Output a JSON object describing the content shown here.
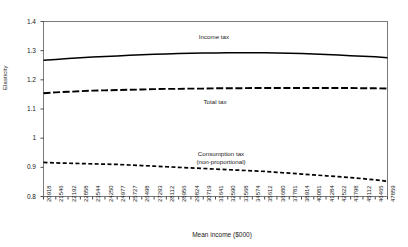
{
  "chart_data": {
    "type": "line",
    "title": "",
    "xlabel": "Mean income ($000)",
    "ylabel": "Elasticity",
    "ylim": [
      0.8,
      1.4
    ],
    "yticks": [
      "0.8",
      "0.9",
      "1",
      "1.1",
      "1.2",
      "1.3",
      "1.4"
    ],
    "ytick_values": [
      0.8,
      0.9,
      1.0,
      1.1,
      1.2,
      1.3,
      1.4
    ],
    "grid": false,
    "legend_position": "inline-annotations",
    "categories": [
      "20918",
      "21546",
      "22192",
      "22858",
      "23544",
      "24250",
      "24977",
      "25727",
      "26498",
      "27293",
      "28112",
      "28956",
      "29824",
      "30719",
      "31641",
      "32590",
      "33568",
      "34574",
      "35612",
      "36680",
      "37781",
      "38914",
      "40081",
      "41284",
      "42522",
      "43798",
      "45112",
      "46465",
      "47859"
    ],
    "series": [
      {
        "name": "Income tax",
        "style": "solid",
        "color": "#000000",
        "label_text": "Income tax",
        "values": [
          1.267,
          1.27,
          1.273,
          1.276,
          1.278,
          1.28,
          1.282,
          1.284,
          1.286,
          1.288,
          1.289,
          1.29,
          1.291,
          1.292,
          1.292,
          1.293,
          1.293,
          1.293,
          1.293,
          1.292,
          1.291,
          1.29,
          1.289,
          1.287,
          1.285,
          1.283,
          1.281,
          1.279,
          1.276
        ]
      },
      {
        "name": "Total tax",
        "style": "dashed",
        "color": "#000000",
        "label_text": "Total tax",
        "values": [
          1.154,
          1.157,
          1.159,
          1.161,
          1.163,
          1.164,
          1.165,
          1.166,
          1.167,
          1.168,
          1.169,
          1.169,
          1.17,
          1.17,
          1.171,
          1.171,
          1.171,
          1.172,
          1.172,
          1.172,
          1.172,
          1.172,
          1.172,
          1.172,
          1.172,
          1.172,
          1.171,
          1.171,
          1.17
        ]
      },
      {
        "name": "Consumption tax (non-proportional)",
        "style": "dashed-small",
        "color": "#000000",
        "label_text": "Consumption tax",
        "label_text2": "(non-proportional)",
        "values": [
          0.917,
          0.915,
          0.914,
          0.913,
          0.912,
          0.911,
          0.91,
          0.908,
          0.906,
          0.904,
          0.902,
          0.9,
          0.898,
          0.896,
          0.894,
          0.892,
          0.89,
          0.888,
          0.886,
          0.883,
          0.88,
          0.877,
          0.874,
          0.871,
          0.868,
          0.865,
          0.861,
          0.857,
          0.852
        ]
      }
    ]
  }
}
